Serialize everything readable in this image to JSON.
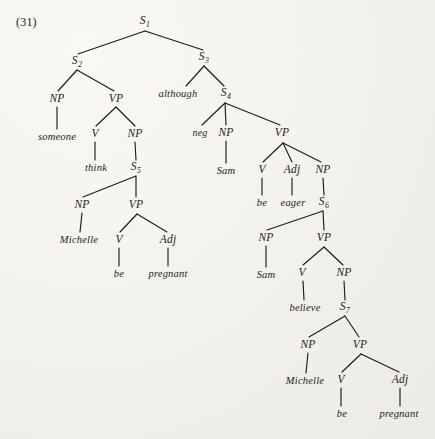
{
  "figure": {
    "example_number": "(31)",
    "ink_color": "#1d1c1a",
    "page_color": "#f4f2ee"
  },
  "nodes": [
    {
      "id": "S1",
      "label": "S",
      "sub": "1",
      "kind": "category",
      "x": 145,
      "y": 22
    },
    {
      "id": "S2",
      "label": "S",
      "sub": "2",
      "kind": "category",
      "x": 77,
      "y": 62
    },
    {
      "id": "S3",
      "label": "S",
      "sub": "3",
      "kind": "category",
      "x": 204,
      "y": 58
    },
    {
      "id": "NP_someone",
      "label": "NP",
      "sub": "",
      "kind": "category",
      "x": 57,
      "y": 99
    },
    {
      "id": "VP_think",
      "label": "VP",
      "sub": "",
      "kind": "category",
      "x": 116,
      "y": 99
    },
    {
      "id": "although",
      "label": "although",
      "sub": "",
      "kind": "conj",
      "x": 178,
      "y": 94
    },
    {
      "id": "S4",
      "label": "S",
      "sub": "4",
      "kind": "category",
      "x": 226,
      "y": 94
    },
    {
      "id": "someone",
      "label": "someone",
      "sub": "",
      "kind": "word",
      "x": 57,
      "y": 137
    },
    {
      "id": "V_think",
      "label": "V",
      "sub": "",
      "kind": "category",
      "x": 95,
      "y": 134
    },
    {
      "id": "NP_S5",
      "label": "NP",
      "sub": "",
      "kind": "category",
      "x": 135,
      "y": 134
    },
    {
      "id": "neg",
      "label": "neg",
      "sub": "",
      "kind": "neg",
      "x": 200,
      "y": 133
    },
    {
      "id": "NP_Sam1",
      "label": "NP",
      "sub": "",
      "kind": "category",
      "x": 226,
      "y": 133
    },
    {
      "id": "VP_eager",
      "label": "VP",
      "sub": "",
      "kind": "category",
      "x": 282,
      "y": 133
    },
    {
      "id": "think",
      "label": "think",
      "sub": "",
      "kind": "word",
      "x": 96,
      "y": 168
    },
    {
      "id": "S5",
      "label": "S",
      "sub": "5",
      "kind": "category",
      "x": 136,
      "y": 168
    },
    {
      "id": "Sam1",
      "label": "Sam",
      "sub": "",
      "kind": "word",
      "x": 226,
      "y": 171
    },
    {
      "id": "V_be1",
      "label": "V",
      "sub": "",
      "kind": "category",
      "x": 262,
      "y": 170
    },
    {
      "id": "Adj_eager",
      "label": "Adj",
      "sub": "",
      "kind": "category",
      "x": 292,
      "y": 170
    },
    {
      "id": "NP_S6",
      "label": "NP",
      "sub": "",
      "kind": "category",
      "x": 323,
      "y": 170
    },
    {
      "id": "NP_Michelle1",
      "label": "NP",
      "sub": "",
      "kind": "category",
      "x": 82,
      "y": 205
    },
    {
      "id": "VP_be1",
      "label": "VP",
      "sub": "",
      "kind": "category",
      "x": 136,
      "y": 205
    },
    {
      "id": "be1",
      "label": "be",
      "sub": "",
      "kind": "word",
      "x": 262,
      "y": 203
    },
    {
      "id": "eager",
      "label": "eager",
      "sub": "",
      "kind": "word",
      "x": 293,
      "y": 203
    },
    {
      "id": "S6",
      "label": "S",
      "sub": "6",
      "kind": "category",
      "x": 324,
      "y": 203
    },
    {
      "id": "Michelle1",
      "label": "Michelle",
      "sub": "",
      "kind": "word",
      "x": 79,
      "y": 240
    },
    {
      "id": "V_be2",
      "label": "V",
      "sub": "",
      "kind": "category",
      "x": 119,
      "y": 240
    },
    {
      "id": "Adj_preg1",
      "label": "Adj",
      "sub": "",
      "kind": "category",
      "x": 168,
      "y": 240
    },
    {
      "id": "NP_Sam2",
      "label": "NP",
      "sub": "",
      "kind": "category",
      "x": 266,
      "y": 238
    },
    {
      "id": "VP_believe",
      "label": "VP",
      "sub": "",
      "kind": "category",
      "x": 324,
      "y": 238
    },
    {
      "id": "be2",
      "label": "be",
      "sub": "",
      "kind": "word",
      "x": 119,
      "y": 274
    },
    {
      "id": "pregnant1",
      "label": "pregnant",
      "sub": "",
      "kind": "word",
      "x": 168,
      "y": 274
    },
    {
      "id": "Sam2",
      "label": "Sam",
      "sub": "",
      "kind": "word",
      "x": 266,
      "y": 275
    },
    {
      "id": "V_believe",
      "label": "V",
      "sub": "",
      "kind": "category",
      "x": 302,
      "y": 273
    },
    {
      "id": "NP_S7",
      "label": "NP",
      "sub": "",
      "kind": "category",
      "x": 344,
      "y": 273
    },
    {
      "id": "believe",
      "label": "believe",
      "sub": "",
      "kind": "word",
      "x": 305,
      "y": 308
    },
    {
      "id": "S7",
      "label": "S",
      "sub": "7",
      "kind": "category",
      "x": 345,
      "y": 308
    },
    {
      "id": "NP_Michelle2",
      "label": "NP",
      "sub": "",
      "kind": "category",
      "x": 308,
      "y": 345
    },
    {
      "id": "VP_be2",
      "label": "VP",
      "sub": "",
      "kind": "category",
      "x": 360,
      "y": 345
    },
    {
      "id": "Michelle2",
      "label": "Michelle",
      "sub": "",
      "kind": "word",
      "x": 305,
      "y": 381
    },
    {
      "id": "V_be3",
      "label": "V",
      "sub": "",
      "kind": "category",
      "x": 341,
      "y": 380
    },
    {
      "id": "Adj_preg2",
      "label": "Adj",
      "sub": "",
      "kind": "category",
      "x": 400,
      "y": 380
    },
    {
      "id": "be3",
      "label": "be",
      "sub": "",
      "kind": "word",
      "x": 342,
      "y": 414
    },
    {
      "id": "pregnant2",
      "label": "pregnant",
      "sub": "",
      "kind": "word",
      "x": 399,
      "y": 414
    }
  ],
  "edges": [
    {
      "from": "S1",
      "to": "S2",
      "x1": 145,
      "y1": 31,
      "x2": 78,
      "y2": 54
    },
    {
      "from": "S1",
      "to": "S3",
      "x1": 145,
      "y1": 31,
      "x2": 203,
      "y2": 50
    },
    {
      "from": "S2",
      "to": "NP_someone",
      "x1": 77,
      "y1": 70,
      "x2": 58,
      "y2": 91
    },
    {
      "from": "S2",
      "to": "VP_think",
      "x1": 77,
      "y1": 70,
      "x2": 114,
      "y2": 91
    },
    {
      "from": "S3",
      "to": "although",
      "x1": 204,
      "y1": 66,
      "x2": 186,
      "y2": 86
    },
    {
      "from": "S3",
      "to": "S4",
      "x1": 204,
      "y1": 66,
      "x2": 224,
      "y2": 86
    },
    {
      "from": "NP_someone",
      "to": "someone",
      "x1": 57,
      "y1": 107,
      "x2": 57,
      "y2": 129
    },
    {
      "from": "VP_think",
      "to": "V_think",
      "x1": 116,
      "y1": 107,
      "x2": 96,
      "y2": 126
    },
    {
      "from": "VP_think",
      "to": "NP_S5",
      "x1": 116,
      "y1": 107,
      "x2": 135,
      "y2": 126
    },
    {
      "from": "S4",
      "to": "neg",
      "x1": 225,
      "y1": 103,
      "x2": 202,
      "y2": 125
    },
    {
      "from": "S4",
      "to": "NP_Sam1",
      "x1": 225,
      "y1": 103,
      "x2": 226,
      "y2": 125
    },
    {
      "from": "S4",
      "to": "VP_eager",
      "x1": 225,
      "y1": 103,
      "x2": 280,
      "y2": 125
    },
    {
      "from": "V_think",
      "to": "think",
      "x1": 95,
      "y1": 142,
      "x2": 95,
      "y2": 160
    },
    {
      "from": "NP_S5",
      "to": "S5",
      "x1": 135,
      "y1": 142,
      "x2": 136,
      "y2": 160
    },
    {
      "from": "NP_Sam1",
      "to": "Sam1",
      "x1": 226,
      "y1": 141,
      "x2": 226,
      "y2": 163
    },
    {
      "from": "VP_eager",
      "to": "V_be1",
      "x1": 283,
      "y1": 143,
      "x2": 263,
      "y2": 162
    },
    {
      "from": "VP_eager",
      "to": "Adj_eager",
      "x1": 283,
      "y1": 143,
      "x2": 292,
      "y2": 162
    },
    {
      "from": "VP_eager",
      "to": "NP_S6",
      "x1": 283,
      "y1": 143,
      "x2": 321,
      "y2": 162
    },
    {
      "from": "S5",
      "to": "NP_Michelle1",
      "x1": 136,
      "y1": 176,
      "x2": 83,
      "y2": 197
    },
    {
      "from": "S5",
      "to": "VP_be1",
      "x1": 136,
      "y1": 176,
      "x2": 136,
      "y2": 197
    },
    {
      "from": "V_be1",
      "to": "be1",
      "x1": 262,
      "y1": 178,
      "x2": 262,
      "y2": 195
    },
    {
      "from": "Adj_eager",
      "to": "eager",
      "x1": 292,
      "y1": 178,
      "x2": 292,
      "y2": 195
    },
    {
      "from": "NP_S6",
      "to": "S6",
      "x1": 323,
      "y1": 178,
      "x2": 324,
      "y2": 195
    },
    {
      "from": "NP_Michelle1",
      "to": "Michelle1",
      "x1": 82,
      "y1": 213,
      "x2": 80,
      "y2": 232
    },
    {
      "from": "VP_be1",
      "to": "V_be2",
      "x1": 137,
      "y1": 214,
      "x2": 120,
      "y2": 232
    },
    {
      "from": "VP_be1",
      "to": "Adj_preg1",
      "x1": 137,
      "y1": 214,
      "x2": 167,
      "y2": 232
    },
    {
      "from": "S6",
      "to": "NP_Sam2",
      "x1": 323,
      "y1": 211,
      "x2": 267,
      "y2": 230
    },
    {
      "from": "S6",
      "to": "VP_believe",
      "x1": 323,
      "y1": 211,
      "x2": 324,
      "y2": 230
    },
    {
      "from": "V_be2",
      "to": "be2",
      "x1": 119,
      "y1": 248,
      "x2": 119,
      "y2": 266
    },
    {
      "from": "Adj_preg1",
      "to": "pregnant1",
      "x1": 168,
      "y1": 248,
      "x2": 168,
      "y2": 266
    },
    {
      "from": "NP_Sam2",
      "to": "Sam2",
      "x1": 266,
      "y1": 246,
      "x2": 266,
      "y2": 267
    },
    {
      "from": "VP_believe",
      "to": "V_believe",
      "x1": 324,
      "y1": 247,
      "x2": 303,
      "y2": 265
    },
    {
      "from": "VP_believe",
      "to": "NP_S7",
      "x1": 324,
      "y1": 247,
      "x2": 343,
      "y2": 265
    },
    {
      "from": "V_believe",
      "to": "believe",
      "x1": 303,
      "y1": 281,
      "x2": 304,
      "y2": 300
    },
    {
      "from": "NP_S7",
      "to": "S7",
      "x1": 344,
      "y1": 281,
      "x2": 345,
      "y2": 300
    },
    {
      "from": "S7",
      "to": "NP_Michelle2",
      "x1": 345,
      "y1": 316,
      "x2": 309,
      "y2": 337
    },
    {
      "from": "S7",
      "to": "VP_be2",
      "x1": 345,
      "y1": 316,
      "x2": 359,
      "y2": 337
    },
    {
      "from": "NP_Michelle2",
      "to": "Michelle2",
      "x1": 308,
      "y1": 353,
      "x2": 306,
      "y2": 373
    },
    {
      "from": "VP_be2",
      "to": "V_be3",
      "x1": 361,
      "y1": 354,
      "x2": 342,
      "y2": 372
    },
    {
      "from": "VP_be2",
      "to": "Adj_preg2",
      "x1": 361,
      "y1": 354,
      "x2": 399,
      "y2": 372
    },
    {
      "from": "V_be3",
      "to": "be3",
      "x1": 341,
      "y1": 388,
      "x2": 341,
      "y2": 406
    },
    {
      "from": "Adj_preg2",
      "to": "pregnant2",
      "x1": 400,
      "y1": 388,
      "x2": 400,
      "y2": 406
    }
  ]
}
